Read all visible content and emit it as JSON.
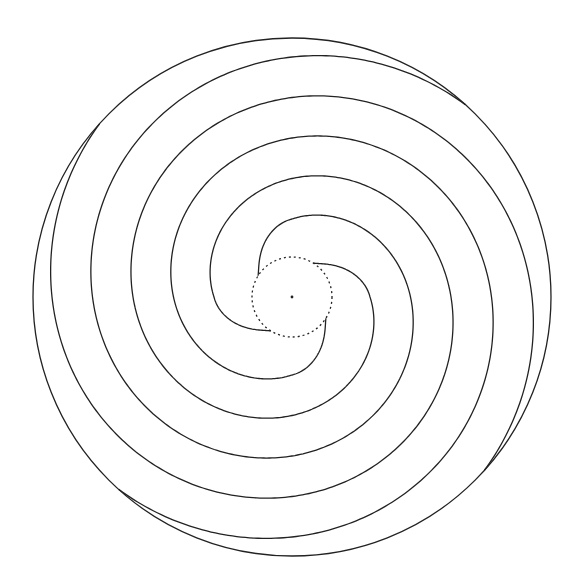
{
  "diagram": {
    "title": "",
    "width": 577,
    "height": 586,
    "center": {
      "x": 292,
      "y": 297
    },
    "colors": {
      "background": "#ffffff",
      "stroke": "#222222",
      "center_dot": "#222222"
    },
    "outer_circle": {
      "radius": 259,
      "stroke_width": 1.3
    },
    "inner_circle": {
      "radius": 40,
      "style": "dotted",
      "dash": "2 3",
      "stroke_width": 1.3
    },
    "center_dot": {
      "radius": 1.4
    },
    "spiral": {
      "arm_count": 4,
      "direction": "clockwise",
      "arm_start_angles_deg": [
        -58,
        32,
        122,
        212
      ],
      "start_radius": 40,
      "first_segment": {
        "sweep_deg": 58,
        "end_radius": 78
      },
      "growth_px_per_deg": 0.45,
      "end_radius": 259,
      "stroke_width": 1.3
    },
    "labels": []
  }
}
